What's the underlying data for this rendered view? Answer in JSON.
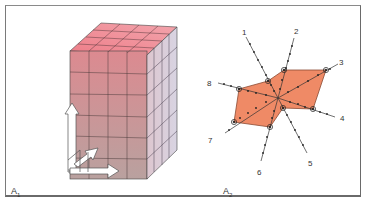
{
  "panels": [
    {
      "id": "A1",
      "label_main": "A",
      "label_sub": "1",
      "description": "Rectangular block subdivided into a grid of cubic cells with three orthogonal axis arrows",
      "grid": {
        "front_columns": 4,
        "rows": 6,
        "depth_columns": 4
      }
    },
    {
      "id": "A2",
      "label_main": "A",
      "label_sub": "2",
      "description": "Star diagram of eight radial axes with a shaded polygon joining circled points",
      "axes": [
        {
          "label": "1"
        },
        {
          "label": "2"
        },
        {
          "label": "3"
        },
        {
          "label": "4"
        },
        {
          "label": "5"
        },
        {
          "label": "6"
        },
        {
          "label": "7"
        },
        {
          "label": "8"
        }
      ]
    }
  ],
  "colors": {
    "cube_top": "#e87a86",
    "cube_front_top": "#d98a8e",
    "cube_front_bottom": "#b89a9a",
    "cube_side": "#d9cdd8",
    "polygon_fill": "#ef8a66",
    "polygon_stroke": "#9a4a30",
    "line": "#333333",
    "frame": "#777777"
  }
}
